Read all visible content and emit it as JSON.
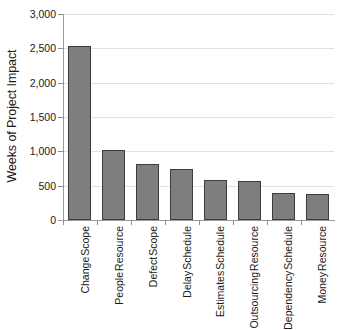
{
  "chart_data": {
    "type": "bar",
    "title": "",
    "subtitle": "",
    "xlabel": "",
    "ylabel": "Weeks of Project Impact",
    "ylim": [
      0,
      3000
    ],
    "ytick_values": [
      0,
      500,
      1000,
      1500,
      2000,
      2500,
      3000
    ],
    "ytick_labels": [
      "0",
      "500",
      "1,000",
      "1,500",
      "2,000",
      "2,500",
      "3,000"
    ],
    "grid": true,
    "legend": null,
    "legend_position": "none",
    "categories": [
      "Scope Change",
      "Resource People",
      "Scope Defect",
      "Schedule Delay",
      "Schedule Estimates",
      "Resource Outsourcing",
      "Schedule Dependency",
      "Resource Money"
    ],
    "category_lines": [
      [
        "Scope",
        "Change"
      ],
      [
        "Resource",
        "People"
      ],
      [
        "Scope",
        "Defect"
      ],
      [
        "Schedule",
        "Delay"
      ],
      [
        "Schedule",
        "Estimates"
      ],
      [
        "Resource",
        "Outsourcing"
      ],
      [
        "Schedule",
        "Dependency"
      ],
      [
        "Resource",
        "Money"
      ]
    ],
    "values": [
      2530,
      1020,
      820,
      740,
      580,
      570,
      390,
      385
    ],
    "bar_color": "#7e7e7e",
    "bar_edge_color": "#3d3d3d",
    "gridline_color": "#e2e2e2",
    "axis_color": "#9a9a9a",
    "text_color": "#1a1a1a",
    "background_color": "#ffffff"
  }
}
